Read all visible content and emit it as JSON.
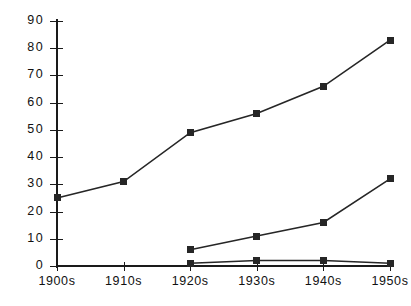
{
  "chart_data": {
    "type": "line",
    "title": "",
    "subtitle": "",
    "xlabel": "",
    "ylabel": "",
    "categories": [
      "1900s",
      "1910s",
      "1920s",
      "1930s",
      "1940s",
      "1950s"
    ],
    "ylim": [
      0,
      90
    ],
    "ytick_labels": [
      "0",
      "10",
      "20",
      "30",
      "40",
      "50",
      "60",
      "70",
      "80",
      "90"
    ],
    "ytick_values": [
      0,
      10,
      20,
      30,
      40,
      50,
      60,
      70,
      80,
      90
    ],
    "grid": false,
    "legend": "none",
    "marker": "square",
    "series": [
      {
        "name": "series-1",
        "color": "#262626",
        "x": [
          "1900s",
          "1910s",
          "1920s",
          "1930s",
          "1940s",
          "1950s"
        ],
        "values": [
          25,
          31,
          49,
          56,
          66,
          83
        ]
      },
      {
        "name": "series-2",
        "color": "#262626",
        "x": [
          "1920s",
          "1930s",
          "1940s",
          "1950s"
        ],
        "values": [
          6,
          11,
          16,
          32
        ]
      },
      {
        "name": "series-3",
        "color": "#262626",
        "x": [
          "1920s",
          "1930s",
          "1940s",
          "1950s"
        ],
        "values": [
          1,
          2,
          2,
          1
        ]
      }
    ]
  },
  "caption": {
    "text": ""
  }
}
